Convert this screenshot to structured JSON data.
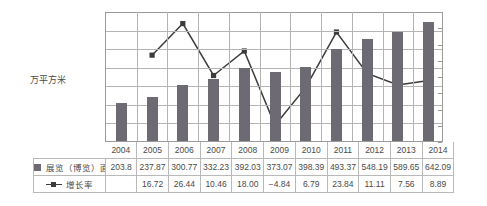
{
  "chart_data": {
    "type": "bar",
    "title": "",
    "xlabel": "",
    "ylabel": "万平方米",
    "y2label": "%",
    "categories": [
      "2004",
      "2005",
      "2006",
      "2007",
      "2008",
      "2009",
      "2010",
      "2011",
      "2012",
      "2013",
      "2014"
    ],
    "ylim": [
      0,
      700
    ],
    "y2lim": [
      -10,
      30
    ],
    "grid": true,
    "legend_position": "table-left",
    "left_ticks": [
      "700",
      "600",
      "500",
      "400",
      "300",
      "200",
      "100",
      "0"
    ],
    "right_ticks": [
      "30",
      "25",
      "20",
      "15",
      "10 %",
      "5",
      "0",
      "−15",
      "−10"
    ],
    "right_ticks_display": [
      "30",
      "25",
      "20",
      "15",
      "10 %",
      "5",
      "0",
      "−5",
      "−10"
    ],
    "series": [
      {
        "name": "展览（博览）面积",
        "type": "bar",
        "axis": "left",
        "color": "#6d6a74",
        "values": [
          203.8,
          237.87,
          300.77,
          332.23,
          392.03,
          373.07,
          398.39,
          493.37,
          548.19,
          589.65,
          642.09
        ],
        "display_values": [
          "203.8",
          "237.87",
          "300.77",
          "332.23",
          "392.03",
          "373.07",
          "398.39",
          "493.37",
          "548.19",
          "589.65",
          "642.09"
        ]
      },
      {
        "name": "增长率",
        "type": "line",
        "axis": "right",
        "color": "#3b3b3b",
        "values": [
          null,
          16.72,
          26.44,
          10.46,
          18.0,
          -4.84,
          6.79,
          23.84,
          11.11,
          7.56,
          8.89
        ],
        "display_values": [
          "",
          "16.72",
          "26.44",
          "10.46",
          "18.00",
          "−4.84",
          "6.79",
          "23.84",
          "11.11",
          "7.56",
          "8.89"
        ]
      }
    ]
  },
  "axis": {
    "left_title": "万平方米"
  },
  "table": {
    "year_header": [
      "2004",
      "2005",
      "2006",
      "2007",
      "2008",
      "2009",
      "2010",
      "2011",
      "2012",
      "2013",
      "2014"
    ],
    "rows": [
      {
        "label": "展览（博览）面积",
        "marker": "bar-swatch",
        "cells": [
          "203.8",
          "237.87",
          "300.77",
          "332.23",
          "392.03",
          "373.07",
          "398.39",
          "493.37",
          "548.19",
          "589.65",
          "642.09"
        ]
      },
      {
        "label": "增长率",
        "marker": "line-swatch",
        "cells": [
          "",
          "16.72",
          "26.44",
          "10.46",
          "18.00",
          "−4.84",
          "6.79",
          "23.84",
          "11.11",
          "7.56",
          "8.89"
        ]
      }
    ]
  },
  "colors": {
    "bar": "#6d6a74",
    "line": "#3b3b3b",
    "grid": "#b4b4b4",
    "axis": "#9a9a9a",
    "text": "#4a4a4a"
  }
}
